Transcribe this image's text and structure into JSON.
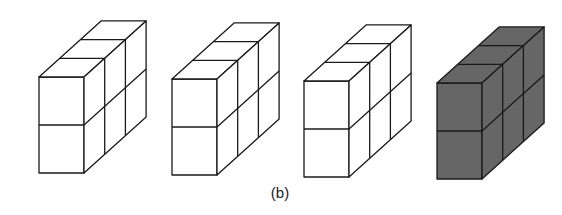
{
  "figure": {
    "caption": "(b)",
    "blocks": [
      {
        "id": "block-1",
        "fill": "#ffffff",
        "x": 39,
        "y": 77
      },
      {
        "id": "block-2",
        "fill": "#ffffff",
        "x": 172,
        "y": 79
      },
      {
        "id": "block-3",
        "fill": "#ffffff",
        "x": 304,
        "y": 81
      },
      {
        "id": "block-4",
        "fill": "#666666",
        "x": 437,
        "y": 83
      }
    ],
    "geometry": {
      "cube_w": 45,
      "cube_h": 48,
      "depth_dx": 20.7,
      "depth_dy": -18.7,
      "depth_units": 3,
      "rows": 2
    },
    "stroke": "#1a1a1a"
  }
}
